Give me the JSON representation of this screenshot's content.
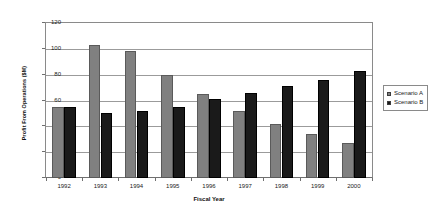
{
  "chart_data": {
    "type": "bar",
    "title": "",
    "xlabel": "Fiscal Year",
    "ylabel": "Profit From Operations ($M)",
    "categories": [
      "1992",
      "1993",
      "1994",
      "1995",
      "1996",
      "1997",
      "1998",
      "1999",
      "2000"
    ],
    "series": [
      {
        "name": "Scenario A",
        "color": "#808080",
        "values": [
          55,
          103,
          98,
          80,
          65,
          52,
          42,
          34,
          27
        ]
      },
      {
        "name": "Scenario B",
        "color": "#1a1a1a",
        "values": [
          55,
          50,
          52,
          55,
          61,
          66,
          71,
          76,
          83
        ]
      }
    ],
    "ylim": [
      0,
      120
    ],
    "yticks": [
      0,
      20,
      40,
      60,
      80,
      100,
      120
    ],
    "ytick_labels": [
      "0",
      "20",
      "40",
      "60",
      "80",
      "100",
      "120"
    ],
    "grid": true,
    "legend_position": "right"
  },
  "legend": {
    "items": [
      {
        "label": "Scenario A",
        "swatch": "gray-square-swatch"
      },
      {
        "label": "Scenario B",
        "swatch": "black-square-swatch"
      }
    ]
  }
}
